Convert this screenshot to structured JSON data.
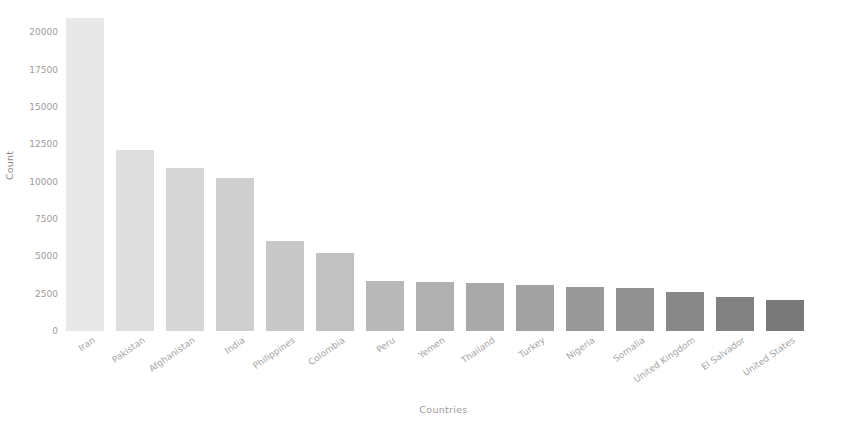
{
  "chart_data": {
    "type": "bar",
    "title": "",
    "xlabel": "Countries",
    "ylabel": "Count",
    "categories": [
      "Iran",
      "Pakistan",
      "Afghanistan",
      "India",
      "Philippines",
      "Colombia",
      "Peru",
      "Yemen",
      "Thailand",
      "Turkey",
      "Nigeria",
      "Somalia",
      "United Kingdom",
      "El Salvador",
      "United States"
    ],
    "values": [
      20950,
      12150,
      10950,
      10250,
      6050,
      5250,
      3350,
      3250,
      3200,
      3100,
      2950,
      2900,
      2600,
      2250,
      2100
    ],
    "ylim": [
      0,
      21500
    ],
    "yticks": [
      0,
      2500,
      5000,
      7500,
      10000,
      12500,
      15000,
      17500,
      20000
    ],
    "ytick_labels": [
      "0",
      "2500",
      "5000",
      "7500",
      "10000",
      "12500",
      "15000",
      "17500",
      "20000"
    ],
    "grid": false,
    "legend": false,
    "bar_colors": [
      "#e8e8e8",
      "#dedede",
      "#d6d6d6",
      "#cfcfcf",
      "#c8c8c8",
      "#c1c1c1",
      "#b8b8b8",
      "#b0b0b0",
      "#a9a9a9",
      "#a2a2a2",
      "#999999",
      "#919191",
      "#888888",
      "#818181",
      "#797979"
    ]
  }
}
